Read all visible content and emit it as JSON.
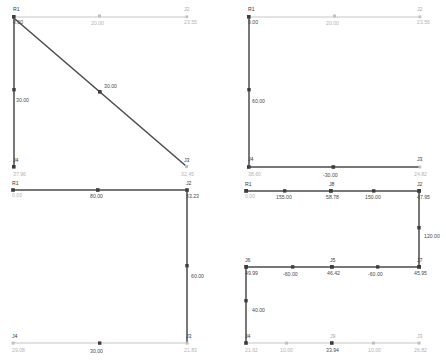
{
  "app": {
    "title": "Structural Frame Diagrams",
    "description": "Four structural frame analysis diagrams arranged in a 2x2 grid showing members, joints and dimension values"
  },
  "colors": {
    "member_active": "#4a4a4a",
    "member_inactive": "#c0c0c0",
    "label_active": "#3a3a3a",
    "label_inactive": "#a8a8a8",
    "value_active": "#4a4a4a",
    "value_inactive": "#b4b4b4",
    "background": "#ffffff"
  },
  "panels": [
    {
      "id": "panel-top-left",
      "position": "top-left",
      "nodes": [
        {
          "name": "R1",
          "label": "R1",
          "value": "0.00",
          "state": "active"
        },
        {
          "name": "J2",
          "label": "J2",
          "value": "23.55",
          "state": "inactive"
        },
        {
          "name": "J4",
          "label": "J4",
          "value": "37.96",
          "state": "active"
        },
        {
          "name": "J3",
          "label": "J3",
          "value": "32.45",
          "state": "inactive"
        }
      ],
      "members": [
        {
          "name": "top-beam",
          "value": "20.00",
          "state": "inactive"
        },
        {
          "name": "left-column",
          "value": "30.00",
          "state": "active"
        },
        {
          "name": "diagonal-brace",
          "value": "30.00",
          "state": "active"
        }
      ]
    },
    {
      "id": "panel-top-right",
      "position": "top-right",
      "nodes": [
        {
          "name": "R1",
          "label": "R1",
          "value": "0.00",
          "state": "active"
        },
        {
          "name": "J2",
          "label": "J2",
          "value": "23.56",
          "state": "inactive"
        },
        {
          "name": "J4",
          "label": "J4",
          "value": "38.60",
          "state": "active"
        },
        {
          "name": "J3",
          "label": "J3",
          "value": "24.82",
          "state": "inactive"
        }
      ],
      "members": [
        {
          "name": "top-beam",
          "value": "20.00",
          "state": "inactive"
        },
        {
          "name": "left-column",
          "value": "60.00",
          "state": "active"
        },
        {
          "name": "bottom-beam",
          "value": "-30.00",
          "state": "active"
        }
      ]
    },
    {
      "id": "panel-bottom-left",
      "position": "bottom-left",
      "nodes": [
        {
          "name": "R1",
          "label": "R1",
          "value": "0.00",
          "state": "active"
        },
        {
          "name": "J2",
          "label": "J2",
          "value": "53.23",
          "state": "active"
        },
        {
          "name": "J4",
          "label": "J4",
          "value": "29.08",
          "state": "inactive"
        },
        {
          "name": "J3",
          "label": "J3",
          "value": "21.83",
          "state": "inactive"
        }
      ],
      "members": [
        {
          "name": "top-beam",
          "value": "80.00",
          "state": "active"
        },
        {
          "name": "right-column",
          "value": "60.00",
          "state": "active"
        },
        {
          "name": "bottom-beam",
          "value": "30.00",
          "state": "inactive"
        }
      ]
    },
    {
      "id": "panel-bottom-right",
      "position": "bottom-right",
      "nodes": [
        {
          "name": "R1",
          "label": "R1",
          "value": "0.00",
          "state": "active"
        },
        {
          "name": "J8",
          "label": "J8",
          "value": "58.78",
          "state": "active"
        },
        {
          "name": "J2",
          "label": "J2",
          "value": "47.95",
          "state": "active"
        },
        {
          "name": "J7",
          "label": "J7",
          "value": "45.95",
          "state": "active"
        },
        {
          "name": "J5",
          "label": "J5",
          "value": "46.42",
          "state": "active"
        },
        {
          "name": "J6",
          "label": "J6",
          "value": "49.99",
          "state": "active"
        },
        {
          "name": "J4",
          "label": "J4",
          "value": "21.62",
          "state": "inactive"
        },
        {
          "name": "J9",
          "label": "J9",
          "value": "33.94",
          "state": "inactive"
        },
        {
          "name": "J3",
          "label": "J3",
          "value": "26.82",
          "state": "inactive"
        }
      ],
      "members": [
        {
          "name": "top-beam-left",
          "value": "155.00",
          "state": "active"
        },
        {
          "name": "top-beam-right",
          "value": "150.00",
          "state": "active"
        },
        {
          "name": "right-column",
          "value": "120.00",
          "state": "active"
        },
        {
          "name": "mid-beam-left",
          "value": "-60.00",
          "state": "active"
        },
        {
          "name": "mid-beam-right",
          "value": "-60.00",
          "state": "active"
        },
        {
          "name": "left-column",
          "value": "40.00",
          "state": "active"
        },
        {
          "name": "bottom-beam-left",
          "value": "10.00",
          "state": "inactive"
        },
        {
          "name": "bottom-beam-right",
          "value": "10.00",
          "state": "inactive"
        }
      ]
    }
  ]
}
